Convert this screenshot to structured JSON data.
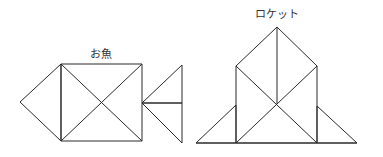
{
  "figures": [
    {
      "id": "fish",
      "label": "お魚"
    },
    {
      "id": "rocket",
      "label": "ロケット"
    }
  ],
  "colors": {
    "stroke": "#2a2a2a",
    "text": "#333333",
    "background": "#ffffff"
  }
}
